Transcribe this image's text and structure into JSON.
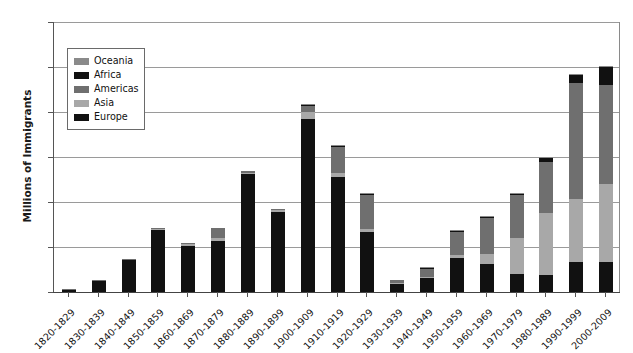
{
  "chart_data": {
    "type": "bar",
    "subtype": "stacked-bar",
    "title": "Immigration to the United States by Region of Origin",
    "xlabel": "",
    "ylabel": "Millions of Immigrants",
    "ylim": [
      0,
      12
    ],
    "yticks": [
      0,
      2,
      4,
      6,
      8,
      10,
      12
    ],
    "ytick_labels": [
      "0",
      "2",
      "4",
      "6",
      "8",
      "10",
      "12"
    ],
    "grid": true,
    "legend_position": "upper-left-inside",
    "categories": [
      "1820-1829",
      "1830-1839",
      "1840-1849",
      "1850-1859",
      "1860-1869",
      "1870-1879",
      "1880-1889",
      "1890-1899",
      "1900-1909",
      "1910-1919",
      "1920-1929",
      "1930-1939",
      "1940-1949",
      "1950-1959",
      "1960-1969",
      "1970-1979",
      "1980-1989",
      "1990-1999",
      "2000-2009"
    ],
    "stack_order_bottom_to_top": [
      "Europe",
      "Asia",
      "Americas",
      "Africa",
      "Oceania"
    ],
    "series": [
      {
        "name": "Europe",
        "color": "#111111",
        "values": [
          0.1,
          0.48,
          1.43,
          2.75,
          2.06,
          2.27,
          5.25,
          3.56,
          7.7,
          5.1,
          2.67,
          0.35,
          0.62,
          1.5,
          1.24,
          0.8,
          0.76,
          1.35,
          1.35
        ]
      },
      {
        "name": "Asia",
        "color": "#a8a8a8",
        "values": [
          0.0,
          0.0,
          0.0,
          0.04,
          0.06,
          0.12,
          0.06,
          0.07,
          0.28,
          0.19,
          0.12,
          0.02,
          0.04,
          0.15,
          0.43,
          1.59,
          2.74,
          2.8,
          3.45
        ]
      },
      {
        "name": "Americas",
        "color": "#6f6f6f",
        "values": [
          0.01,
          0.01,
          0.03,
          0.07,
          0.02,
          0.45,
          0.05,
          0.04,
          0.28,
          1.14,
          1.52,
          0.16,
          0.35,
          1.0,
          1.64,
          1.9,
          2.28,
          5.14,
          4.4
        ]
      },
      {
        "name": "Africa",
        "color": "#111111",
        "values": [
          0.0,
          0.0,
          0.0,
          0.0,
          0.0,
          0.0,
          0.0,
          0.0,
          0.01,
          0.01,
          0.01,
          0.0,
          0.01,
          0.01,
          0.03,
          0.08,
          0.18,
          0.35,
          0.8
        ]
      },
      {
        "name": "Oceania",
        "color": "#8a8a8a",
        "values": [
          0.0,
          0.0,
          0.0,
          0.0,
          0.0,
          0.0,
          0.0,
          0.0,
          0.01,
          0.01,
          0.01,
          0.0,
          0.01,
          0.01,
          0.01,
          0.02,
          0.03,
          0.04,
          0.05
        ]
      }
    ],
    "totals": [
      0.11,
      0.49,
      1.46,
      2.86,
      2.14,
      2.84,
      5.36,
      3.67,
      8.28,
      6.45,
      4.33,
      0.53,
      1.03,
      2.67,
      3.35,
      4.39,
      5.99,
      9.68,
      10.05
    ]
  },
  "legend": {
    "items": [
      {
        "label": "Oceania",
        "color": "#8a8a8a"
      },
      {
        "label": "Africa",
        "color": "#111111"
      },
      {
        "label": "Americas",
        "color": "#6f6f6f"
      },
      {
        "label": "Asia",
        "color": "#a8a8a8"
      },
      {
        "label": "Europe",
        "color": "#111111"
      }
    ]
  },
  "axes": {
    "y_title": "Millions of Immigrants"
  },
  "colors": {
    "europe": "#111111",
    "asia": "#a8a8a8",
    "americas": "#6f6f6f",
    "africa": "#111111",
    "oceania": "#8a8a8a",
    "gridline": "#9a9a9a",
    "axis": "#444444",
    "background": "#ffffff"
  }
}
